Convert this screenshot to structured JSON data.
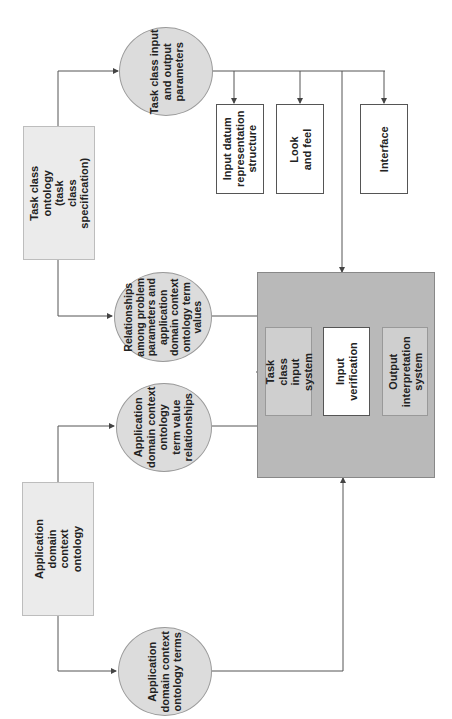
{
  "diagram": {
    "orientation": "rotated 90 degrees counter-clockwise",
    "nodes": {
      "task_class_ontology": "Task class ontology (task\nclass specification)",
      "app_domain_ontology": "Application domain context\nontology",
      "task_io_params": "Task class input\nand output\nparameters",
      "relationships": "Relationships\namong problem\nparameters and\napplication\ndomain context\nontology term\nvalues",
      "term_value_rel": "Application\ndomain context\nontology\nterm value\nrelationships",
      "ontology_terms": "Application\ndomain context\nontology terms",
      "input_datum": "Input datum\nrepresentation\nstructure",
      "look_feel": "Look and feel",
      "interface": "Interface",
      "task_input_system": "Task class input\nsystem",
      "input_verification": "Input verification",
      "output_interpretation": "Output\ninterpretation\nsystem"
    },
    "edges": [
      [
        "task_class_ontology",
        "task_io_params"
      ],
      [
        "task_class_ontology",
        "relationships"
      ],
      [
        "app_domain_ontology",
        "term_value_rel"
      ],
      [
        "app_domain_ontology",
        "ontology_terms"
      ],
      [
        "task_io_params",
        "input_datum"
      ],
      [
        "task_io_params",
        "look_feel"
      ],
      [
        "task_io_params",
        "interface"
      ],
      [
        "task_io_params",
        "system_box"
      ],
      [
        "relationships",
        "system_box"
      ],
      [
        "term_value_rel",
        "system_box"
      ],
      [
        "ontology_terms",
        "system_box"
      ]
    ]
  }
}
